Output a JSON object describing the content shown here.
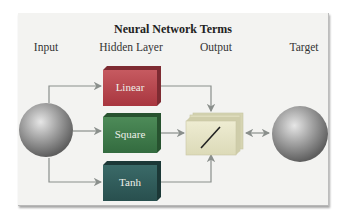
{
  "title": "Neural Network Terms",
  "columns": [
    {
      "label": "Input"
    },
    {
      "label": "Hidden Layer"
    },
    {
      "label": "Output"
    },
    {
      "label": "Target"
    }
  ],
  "hidden_units": [
    {
      "label": "Linear",
      "color": "#b5424a"
    },
    {
      "label": "Square",
      "color": "#3e7a4a"
    },
    {
      "label": "Tanh",
      "color": "#2f5b5a"
    }
  ],
  "output_unit": {
    "icon": "linear-activation-icon",
    "color": "#e6e4c4"
  },
  "nodes": {
    "input": {
      "icon": "sphere-icon"
    },
    "target": {
      "icon": "sphere-icon"
    }
  },
  "colors": {
    "panel_bg": "#f3f3f1",
    "arrow": "#8a8f8c",
    "sphere": "#9a9a9a"
  }
}
